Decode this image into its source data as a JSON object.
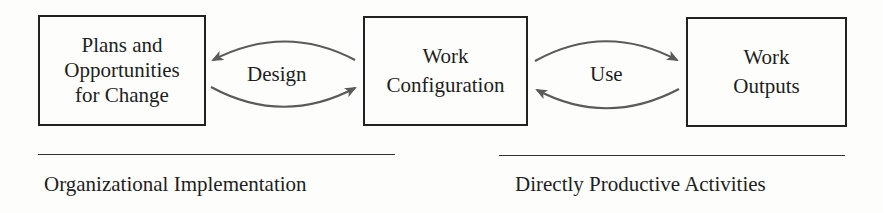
{
  "diagram": {
    "nodes": [
      {
        "id": "plans",
        "lines": [
          "Plans and",
          "Opportunities",
          "for Change"
        ]
      },
      {
        "id": "work-configuration",
        "lines": [
          "Work",
          "Configuration"
        ]
      },
      {
        "id": "work-outputs",
        "lines": [
          "Work",
          "Outputs"
        ]
      }
    ],
    "edges": [
      {
        "from": "work-configuration",
        "to": "plans",
        "label": "Design",
        "direction": "bidirectional"
      },
      {
        "from": "work-configuration",
        "to": "work-outputs",
        "label": "Use",
        "direction": "bidirectional"
      }
    ],
    "groups": [
      {
        "label": "Organizational Implementation",
        "spans": [
          "plans",
          "work-configuration"
        ]
      },
      {
        "label": "Directly Productive Activities",
        "spans": [
          "work-configuration",
          "work-outputs"
        ]
      }
    ],
    "colors": {
      "box_border": "#222222",
      "arrow": "#5a5a5a",
      "text": "#1e1e1e",
      "background": "#fdfdfb"
    }
  }
}
